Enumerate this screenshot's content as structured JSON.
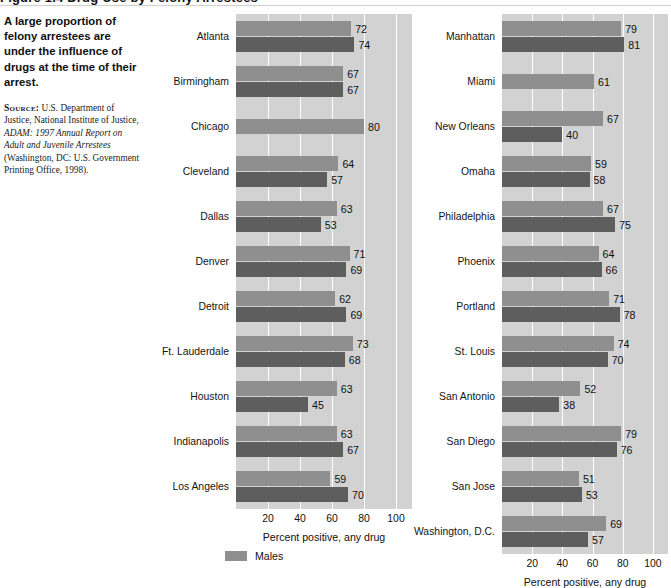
{
  "title_strip": {
    "text": "Figure 1.4  Drug Use by Felony Arrestees"
  },
  "sidenote": {
    "lede": "A large proportion of felony arrestees are under the influence of drugs at the time of their arrest.",
    "source_label": "Source:",
    "source_part1": " U.S. Department of Justice, National Institute of Justice, ",
    "source_italic": "ADAM: 1997 Annual Report on Adult and Juvenile Arrestees",
    "source_part2": " (Washington, DC: U.S. Government Printing Office, 1998)."
  },
  "legend": {
    "items": [
      {
        "label": "Males",
        "color": "#8f8f8f"
      }
    ]
  },
  "colors": {
    "males": "#8f8f8f",
    "females": "#5e5e5e",
    "plot_background": "#d2d2d2",
    "gridline": "#ffffff"
  },
  "chart_data": [
    {
      "id": "left",
      "type": "bar",
      "orientation": "horizontal",
      "title": "",
      "xlabel": "Percent positive, any drug",
      "ylabel": "",
      "xlim": [
        0,
        110
      ],
      "xticks": [
        20,
        40,
        60,
        80,
        100
      ],
      "grid": true,
      "legend_position": "bottom-center",
      "categories": [
        "Atlanta",
        "Birmingham",
        "Chicago",
        "Cleveland",
        "Dallas",
        "Denver",
        "Detroit",
        "Ft. Lauderdale",
        "Houston",
        "Indianapolis",
        "Los Angeles"
      ],
      "series": [
        {
          "name": "Males",
          "color": "#8f8f8f",
          "values": [
            72,
            67,
            80,
            64,
            63,
            71,
            62,
            73,
            63,
            63,
            59
          ]
        },
        {
          "name": "Females",
          "color": "#5e5e5e",
          "values": [
            74,
            67,
            null,
            57,
            53,
            69,
            69,
            68,
            45,
            67,
            70
          ]
        }
      ]
    },
    {
      "id": "right",
      "type": "bar",
      "orientation": "horizontal",
      "title": "",
      "xlabel": "Percent positive, any drug",
      "ylabel": "",
      "xlim": [
        0,
        110
      ],
      "xticks": [
        20,
        40,
        60,
        80,
        100
      ],
      "grid": true,
      "legend_position": "bottom-center",
      "categories": [
        "Manhattan",
        "Miami",
        "New Orleans",
        "Omaha",
        "Philadelphia",
        "Phoenix",
        "Portland",
        "St. Louis",
        "San Antonio",
        "San Diego",
        "San Jose",
        "Washington, D.C."
      ],
      "series": [
        {
          "name": "Males",
          "color": "#8f8f8f",
          "values": [
            79,
            61,
            67,
            59,
            67,
            64,
            71,
            74,
            52,
            79,
            51,
            69
          ]
        },
        {
          "name": "Females",
          "color": "#5e5e5e",
          "values": [
            81,
            null,
            40,
            58,
            75,
            66,
            78,
            70,
            38,
            76,
            53,
            57
          ]
        }
      ]
    }
  ]
}
